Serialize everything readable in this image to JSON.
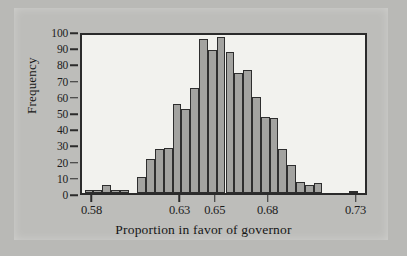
{
  "figure": {
    "background_color": "#b9b9b6",
    "panel_color": "#f2f2ee",
    "bar_fill_color": "#a3a3a0",
    "bar_edge_color": "#2e2e2e",
    "axis_color": "#2b2b2b"
  },
  "chart_data": {
    "type": "bar",
    "chart_subtype": "histogram",
    "title": "",
    "xlabel": "Proportion in favor of governor",
    "ylabel": "Frequency",
    "xlim": [
      0.5735,
      0.7365
    ],
    "ylim": [
      0,
      100
    ],
    "grid": false,
    "legend": null,
    "bin_width": 0.005,
    "x_tick_values": [
      0.58,
      0.63,
      0.65,
      0.68,
      0.73
    ],
    "x_tick_labels": [
      "0.58",
      "0.63",
      "0.65",
      "0.68",
      "0.73"
    ],
    "y_tick_values": [
      0,
      10,
      20,
      30,
      40,
      50,
      60,
      70,
      80,
      90,
      100
    ],
    "y_tick_labels": [
      "0",
      "10",
      "20",
      "30",
      "40",
      "50",
      "60",
      "70",
      "80",
      "90",
      "100"
    ],
    "bins": [
      {
        "left": 0.575,
        "right": 0.58,
        "value": 2
      },
      {
        "left": 0.58,
        "right": 0.585,
        "value": 2
      },
      {
        "left": 0.585,
        "right": 0.59,
        "value": 5
      },
      {
        "left": 0.59,
        "right": 0.595,
        "value": 2
      },
      {
        "left": 0.595,
        "right": 0.6,
        "value": 2
      },
      {
        "left": 0.605,
        "right": 0.61,
        "value": 10
      },
      {
        "left": 0.61,
        "right": 0.615,
        "value": 21
      },
      {
        "left": 0.615,
        "right": 0.62,
        "value": 27
      },
      {
        "left": 0.62,
        "right": 0.625,
        "value": 28
      },
      {
        "left": 0.625,
        "right": 0.63,
        "value": 55
      },
      {
        "left": 0.63,
        "right": 0.635,
        "value": 52
      },
      {
        "left": 0.635,
        "right": 0.64,
        "value": 65
      },
      {
        "left": 0.64,
        "right": 0.645,
        "value": 95
      },
      {
        "left": 0.645,
        "right": 0.65,
        "value": 88
      },
      {
        "left": 0.65,
        "right": 0.655,
        "value": 96
      },
      {
        "left": 0.655,
        "right": 0.66,
        "value": 87
      },
      {
        "left": 0.66,
        "right": 0.665,
        "value": 74
      },
      {
        "left": 0.665,
        "right": 0.67,
        "value": 76
      },
      {
        "left": 0.67,
        "right": 0.675,
        "value": 59
      },
      {
        "left": 0.675,
        "right": 0.68,
        "value": 47
      },
      {
        "left": 0.68,
        "right": 0.685,
        "value": 46
      },
      {
        "left": 0.685,
        "right": 0.69,
        "value": 27
      },
      {
        "left": 0.69,
        "right": 0.695,
        "value": 17
      },
      {
        "left": 0.695,
        "right": 0.7,
        "value": 7
      },
      {
        "left": 0.7,
        "right": 0.705,
        "value": 5
      },
      {
        "left": 0.705,
        "right": 0.71,
        "value": 6
      },
      {
        "left": 0.725,
        "right": 0.73,
        "value": 1
      }
    ],
    "categories": [
      "0.5750",
      "0.5800",
      "0.5850",
      "0.5900",
      "0.5950",
      "0.6050",
      "0.6100",
      "0.6150",
      "0.6200",
      "0.6250",
      "0.6300",
      "0.6350",
      "0.6400",
      "0.6450",
      "0.6500",
      "0.6550",
      "0.6600",
      "0.6650",
      "0.6700",
      "0.6750",
      "0.6800",
      "0.6850",
      "0.6900",
      "0.6950",
      "0.7000",
      "0.7050",
      "0.7250"
    ],
    "values": [
      2,
      2,
      5,
      2,
      2,
      10,
      21,
      27,
      28,
      55,
      52,
      65,
      95,
      88,
      96,
      87,
      74,
      76,
      59,
      47,
      46,
      27,
      17,
      7,
      5,
      6,
      1
    ]
  }
}
